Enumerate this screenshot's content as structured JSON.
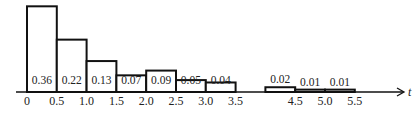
{
  "chart_data": {
    "type": "bar",
    "subtype": "histogram",
    "title": "",
    "xlabel": "t",
    "ylabel": "",
    "bins": [
      {
        "start": 0.0,
        "end": 0.5,
        "value": 0.36,
        "label": "0.36"
      },
      {
        "start": 0.5,
        "end": 1.0,
        "value": 0.22,
        "label": "0.22"
      },
      {
        "start": 1.0,
        "end": 1.5,
        "value": 0.13,
        "label": "0.13"
      },
      {
        "start": 1.5,
        "end": 2.0,
        "value": 0.07,
        "label": "0.07"
      },
      {
        "start": 2.0,
        "end": 2.5,
        "value": 0.09,
        "label": "0.09"
      },
      {
        "start": 2.5,
        "end": 3.0,
        "value": 0.05,
        "label": "0.05"
      },
      {
        "start": 3.0,
        "end": 3.5,
        "value": 0.04,
        "label": "0.04"
      },
      {
        "start": 4.0,
        "end": 4.5,
        "value": 0.02,
        "label": "0.02"
      },
      {
        "start": 4.5,
        "end": 5.0,
        "value": 0.01,
        "label": "0.01"
      },
      {
        "start": 5.0,
        "end": 5.5,
        "value": 0.01,
        "label": "0.01"
      }
    ],
    "categories": [
      "0-0.5",
      "0.5-1.0",
      "1.0-1.5",
      "1.5-2.0",
      "2.0-2.5",
      "2.5-3.0",
      "3.0-3.5",
      "4.0-4.5",
      "4.5-5.0",
      "5.0-5.5"
    ],
    "values": [
      0.36,
      0.22,
      0.13,
      0.07,
      0.09,
      0.05,
      0.04,
      0.02,
      0.01,
      0.01
    ],
    "x_tick_labels": [
      "0",
      "0.5",
      "1.0",
      "1.5",
      "2.0",
      "2.5",
      "3.0",
      "3.5",
      "4.5",
      "5.0",
      "5.5"
    ],
    "x_ticks": [
      0,
      0.5,
      1.0,
      1.5,
      2.0,
      2.5,
      3.0,
      3.5,
      4.5,
      5.0,
      5.5
    ],
    "xlim": [
      -0.2,
      6.4
    ],
    "grid": false,
    "legend": null,
    "annotations": "Each bar is labeled with its relative frequency; bars 0-3.5 labeled inside near base, bars 4.0-5.5 labeled above"
  }
}
